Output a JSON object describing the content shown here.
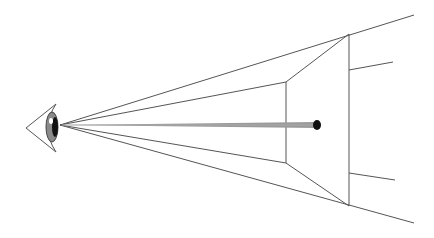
{
  "diagram": {
    "colors": {
      "background": "#ffffff",
      "line": "#555555",
      "rod": "#999999",
      "dot": "#111111",
      "eye_iris": "#777777",
      "eye_pupil": "#111111"
    },
    "eye": {
      "cx": 50,
      "cy": 125
    },
    "apex": {
      "x": 60,
      "y": 125
    },
    "frustum": {
      "near_frame": {
        "top": [
          286,
          82
        ],
        "bottom": [
          286,
          163
        ]
      },
      "far_frame": {
        "top": [
          349,
          34
        ],
        "bottom": [
          349,
          206
        ]
      },
      "extended_rays": {
        "top": [
          414,
          15
        ],
        "bottom": [
          414,
          223
        ]
      },
      "side_lines": [
        {
          "from": [
            349,
            70
          ],
          "to": [
            393,
            62
          ]
        },
        {
          "from": [
            349,
            173
          ],
          "to": [
            395,
            180
          ]
        }
      ]
    },
    "rod": {
      "from": [
        62,
        125
      ],
      "to": [
        317,
        125
      ]
    },
    "target_point": {
      "x": 317,
      "y": 125
    }
  }
}
